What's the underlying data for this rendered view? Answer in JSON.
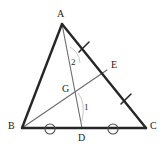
{
  "figure": {
    "background_color": "#ffffff",
    "width": 167,
    "height": 150,
    "stroke_dark": "#262626",
    "stroke_light": "#6b6b6b",
    "stroke_faint": "#b8b8b8",
    "label_color": "#1a1a1a"
  },
  "points": {
    "A": {
      "label": "A",
      "x": 62,
      "y": 24,
      "label_x": 57,
      "label_y": 9
    },
    "B": {
      "label": "B",
      "x": 22,
      "y": 128,
      "label_x": 8,
      "label_y": 121
    },
    "C": {
      "label": "C",
      "x": 146,
      "y": 128,
      "label_x": 150,
      "label_y": 121
    },
    "D": {
      "label": "D",
      "x": 82,
      "y": 128,
      "label_x": 78,
      "label_y": 133
    },
    "E": {
      "label": "E",
      "x": 107,
      "y": 70,
      "label_x": 111,
      "label_y": 60
    },
    "G": {
      "label": "G",
      "x": 72,
      "y": 93,
      "label_x": 62,
      "label_y": 84
    }
  },
  "segments": [
    {
      "name": "side-AB",
      "from": "A",
      "to": "B",
      "style": "thick"
    },
    {
      "name": "side-BC",
      "from": "B",
      "to": "C",
      "style": "thick"
    },
    {
      "name": "side-AC",
      "from": "A",
      "to": "C",
      "style": "thick"
    },
    {
      "name": "cevian-AD",
      "from": "A",
      "to": "D",
      "style": "thin"
    },
    {
      "name": "cevian-BE",
      "from": "B",
      "to": "E",
      "style": "thin"
    }
  ],
  "tick_marks": [
    {
      "name": "tick-AE",
      "x": 84,
      "y": 47,
      "angle": 120,
      "length": 11
    },
    {
      "name": "tick-EC",
      "x": 126,
      "y": 99,
      "angle": 120,
      "length": 11
    }
  ],
  "circle_marks": [
    {
      "name": "circle-mark-BD",
      "x": 50,
      "y": 129,
      "r": 5
    },
    {
      "name": "circle-mark-DC",
      "x": 113,
      "y": 129,
      "r": 5
    }
  ],
  "angle_labels": [
    {
      "name": "angle-label-2",
      "text": "2",
      "x": 71,
      "y": 58
    },
    {
      "name": "angle-label-1",
      "text": "1",
      "x": 84,
      "y": 103
    }
  ],
  "angle_arcs": [
    {
      "name": "angle-arc-2",
      "path": "M 70 47 Q 79 52 80 63"
    },
    {
      "name": "angle-arc-1",
      "path": "M 78 93 Q 85 102 82 120"
    }
  ]
}
